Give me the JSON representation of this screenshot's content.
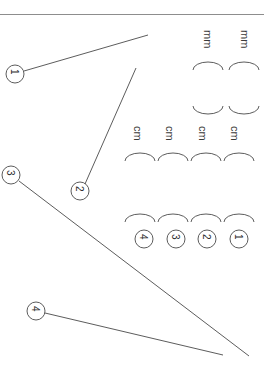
{
  "page": {
    "width": 264,
    "height": 372,
    "background": "#ffffff",
    "orientation": "rotated-90",
    "rule_color": "#8d8d8d",
    "stroke_color": "#4a4a4a",
    "text_color": "#3a3a3a"
  },
  "divider": {
    "name": "top-horizontal-rule"
  },
  "unit_labels": [
    {
      "text": "mm",
      "x": 213,
      "y": 30
    },
    {
      "text": "mm",
      "x": 250,
      "y": 30
    },
    {
      "text": "cm",
      "x": 143,
      "y": 126
    },
    {
      "text": "cm",
      "x": 175,
      "y": 126
    },
    {
      "text": "cm",
      "x": 208,
      "y": 126
    },
    {
      "text": "cm",
      "x": 240,
      "y": 126
    }
  ],
  "arcs": [
    {
      "name": "arc-mm-upper-1",
      "cx": 208,
      "cy": 70,
      "rx": 15,
      "ry": 8,
      "dir": "up"
    },
    {
      "name": "arc-mm-upper-2",
      "cx": 244,
      "cy": 70,
      "rx": 15,
      "ry": 8,
      "dir": "up"
    },
    {
      "name": "arc-mm-lower-1",
      "cx": 208,
      "cy": 106,
      "rx": 15,
      "ry": 8,
      "dir": "down"
    },
    {
      "name": "arc-mm-lower-2",
      "cx": 244,
      "cy": 106,
      "rx": 15,
      "ry": 8,
      "dir": "down"
    },
    {
      "name": "arc-cm-upper-1",
      "cx": 140,
      "cy": 161,
      "rx": 15,
      "ry": 8,
      "dir": "up"
    },
    {
      "name": "arc-cm-upper-2",
      "cx": 173,
      "cy": 161,
      "rx": 15,
      "ry": 8,
      "dir": "up"
    },
    {
      "name": "arc-cm-upper-3",
      "cx": 206,
      "cy": 161,
      "rx": 15,
      "ry": 8,
      "dir": "up"
    },
    {
      "name": "arc-cm-upper-4",
      "cx": 239,
      "cy": 161,
      "rx": 15,
      "ry": 8,
      "dir": "up"
    },
    {
      "name": "arc-cm-lower-1",
      "cx": 140,
      "cy": 222,
      "rx": 15,
      "ry": 8,
      "dir": "up"
    },
    {
      "name": "arc-cm-lower-2",
      "cx": 173,
      "cy": 222,
      "rx": 15,
      "ry": 8,
      "dir": "up"
    },
    {
      "name": "arc-cm-lower-3",
      "cx": 206,
      "cy": 222,
      "rx": 15,
      "ry": 8,
      "dir": "up"
    },
    {
      "name": "arc-cm-lower-4",
      "cx": 239,
      "cy": 222,
      "rx": 15,
      "ry": 8,
      "dir": "up"
    }
  ],
  "callouts": [
    {
      "label": "4",
      "name": "callout-4-bottom-left",
      "cx": 36,
      "cy": 311,
      "r": 9,
      "digit_x": 40,
      "digit_y": 306,
      "leader": {
        "x1": 45,
        "y1": 313,
        "x2": 223,
        "y2": 355
      }
    },
    {
      "label": "3",
      "name": "callout-3-left",
      "cx": 11,
      "cy": 175,
      "r": 9,
      "digit_x": 15,
      "digit_y": 170,
      "leader": {
        "x1": 19,
        "y1": 181,
        "x2": 249,
        "y2": 356
      }
    },
    {
      "label": "2",
      "name": "callout-2-middle",
      "cx": 80,
      "cy": 191,
      "r": 9,
      "digit_x": 84,
      "digit_y": 186,
      "leader": {
        "x1": 85,
        "y1": 184,
        "x2": 136,
        "y2": 68
      }
    },
    {
      "label": "1",
      "name": "callout-1-top-left",
      "cx": 15,
      "cy": 74,
      "r": 9,
      "digit_x": 19,
      "digit_y": 69,
      "leader": {
        "x1": 24,
        "y1": 71,
        "x2": 148,
        "y2": 35
      }
    }
  ],
  "row_callouts": [
    {
      "label": "4",
      "name": "row-callout-4",
      "cx": 144,
      "cy": 239,
      "r": 9,
      "digit_x": 148,
      "digit_y": 234
    },
    {
      "label": "3",
      "name": "row-callout-3",
      "cx": 176,
      "cy": 239,
      "r": 9,
      "digit_x": 180,
      "digit_y": 234
    },
    {
      "label": "2",
      "name": "row-callout-2",
      "cx": 207,
      "cy": 239,
      "r": 9,
      "digit_x": 211,
      "digit_y": 234
    },
    {
      "label": "1",
      "name": "row-callout-1",
      "cx": 239,
      "cy": 239,
      "r": 9,
      "digit_x": 243,
      "digit_y": 234
    }
  ]
}
